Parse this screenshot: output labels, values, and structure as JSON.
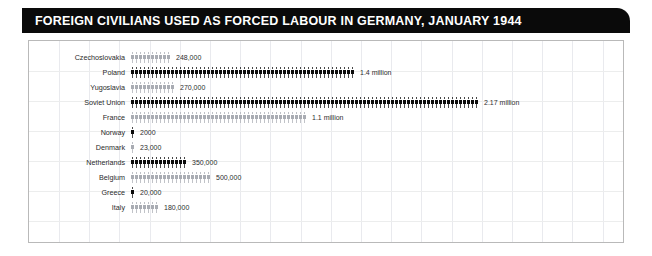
{
  "header": {
    "title": "FOREIGN CIVILIANS USED AS FORCED LABOUR IN GERMANY, JANUARY 1944"
  },
  "colors": {
    "title_bar": "#0a0a0a",
    "title_text": "#ffffff",
    "figure_dark": "#0b0b0b",
    "figure_light": "#a9acb3",
    "grid": "#e9eaee",
    "frame_border": "#b9b9b9"
  },
  "chart_data": {
    "type": "bar",
    "title": "FOREIGN CIVILIANS USED AS FORCED LABOUR IN GERMANY, JANUARY 1944",
    "subtitle": "",
    "xlabel": "",
    "ylabel": "",
    "grid": true,
    "legend": "none",
    "unit_note": "pictogram (isotype) bar chart; each human figure represents a fixed number of forced labourers",
    "xlim": [
      0,
      2170000
    ],
    "categories": [
      "Czechoslovakia",
      "Poland",
      "Yugoslavia",
      "Soviet Union",
      "France",
      "Norway",
      "Denmark",
      "Netherlands",
      "Belgium",
      "Greece",
      "Italy"
    ],
    "values": [
      248000,
      1400000,
      270000,
      2170000,
      1100000,
      2000,
      23000,
      350000,
      500000,
      20000,
      180000
    ],
    "value_labels": [
      "248,000",
      "1.4 million",
      "270,000",
      "2.17 million",
      "1.1 million",
      "2000",
      "23,000",
      "350,000",
      "500,000",
      "20,000",
      "180,000"
    ],
    "rows": [
      {
        "label": "Czechoslovakia",
        "value": 248000,
        "value_label": "248,000",
        "figures": 10,
        "shade": "light"
      },
      {
        "label": "Poland",
        "value": 1400000,
        "value_label": "1.4 million",
        "figures": 56,
        "shade": "dark"
      },
      {
        "label": "Yugoslavia",
        "value": 270000,
        "value_label": "270,000",
        "figures": 11,
        "shade": "light"
      },
      {
        "label": "Soviet Union",
        "value": 2170000,
        "value_label": "2.17 million",
        "figures": 87,
        "shade": "dark"
      },
      {
        "label": "France",
        "value": 1100000,
        "value_label": "1.1 million",
        "figures": 44,
        "shade": "light"
      },
      {
        "label": "Norway",
        "value": 2000,
        "value_label": "2000",
        "figures": 1,
        "shade": "dark"
      },
      {
        "label": "Denmark",
        "value": 23000,
        "value_label": "23,000",
        "figures": 1,
        "shade": "light"
      },
      {
        "label": "Netherlands",
        "value": 350000,
        "value_label": "350,000",
        "figures": 14,
        "shade": "dark"
      },
      {
        "label": "Belgium",
        "value": 500000,
        "value_label": "500,000",
        "figures": 20,
        "shade": "light"
      },
      {
        "label": "Greece",
        "value": 20000,
        "value_label": "20,000",
        "figures": 1,
        "shade": "dark"
      },
      {
        "label": "Italy",
        "value": 180000,
        "value_label": "180,000",
        "figures": 7,
        "shade": "light"
      }
    ]
  }
}
